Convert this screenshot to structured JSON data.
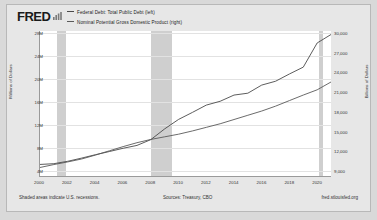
{
  "brand": {
    "logo_text": "FRED",
    "logo_icon": "bar-chart-icon"
  },
  "legend": [
    {
      "label": "Federal Debt: Total Public Debt (left)",
      "color": "#4a4a4a"
    },
    {
      "label": "Nominal Potential Gross Domestic Product (right)",
      "color": "#5a5a5a"
    }
  ],
  "footer": {
    "note": "Shaded areas indicate U.S. recessions.",
    "source": "Sources: Treasury, CBO",
    "url": "fred.stlouisfed.org"
  },
  "chart_data": {
    "type": "line",
    "title": "",
    "xlabel": "",
    "ylabel": "Millions of Dollars",
    "ylabel_right": "Billions of Dollars",
    "grid": true,
    "legend_position": "top-left",
    "xlim": [
      2000,
      2021
    ],
    "ylim_left": [
      4000000,
      28000000
    ],
    "ylim_right": [
      9000,
      30000
    ],
    "x_ticks": [
      "2000",
      "2002",
      "2004",
      "2006",
      "2008",
      "2010",
      "2012",
      "2014",
      "2016",
      "2018",
      "2020"
    ],
    "y_ticks_left": [
      "28M",
      "24M",
      "20M",
      "16M",
      "12M",
      "8M",
      "4M"
    ],
    "y_ticks_right": [
      "30,000",
      "27,000",
      "24,000",
      "21,000",
      "18,000",
      "15,000",
      "12,000",
      "9,000"
    ],
    "recessions": [
      {
        "start": 2001.2,
        "end": 2001.9
      },
      {
        "start": 2007.95,
        "end": 2009.5
      },
      {
        "start": 2020.1,
        "end": 2020.35
      }
    ],
    "x": [
      2000,
      2001,
      2002,
      2003,
      2004,
      2005,
      2006,
      2007,
      2008,
      2009,
      2010,
      2011,
      2012,
      2013,
      2014,
      2015,
      2016,
      2017,
      2018,
      2019,
      2020,
      2021
    ],
    "series": [
      {
        "name": "Federal Debt: Total Public Debt (left)",
        "axis": "left",
        "units": "Millions of Dollars",
        "color": "#4a4a4a",
        "values": [
          5674000,
          5807000,
          6228000,
          6783000,
          7379000,
          7933000,
          8507000,
          9008000,
          10025000,
          11910000,
          13562000,
          14790000,
          16066000,
          16738000,
          17824000,
          18151000,
          19573000,
          20245000,
          21516000,
          22719000,
          26945000,
          28429000
        ]
      },
      {
        "name": "Nominal Potential Gross Domestic Product (right)",
        "axis": "right",
        "units": "Billions of Dollars",
        "color": "#5a5a5a",
        "values": [
          10000,
          10450,
          10850,
          11300,
          11900,
          12550,
          13200,
          13800,
          14300,
          14700,
          15100,
          15600,
          16150,
          16700,
          17350,
          18000,
          18650,
          19400,
          20250,
          21100,
          21900,
          23100
        ]
      }
    ]
  }
}
